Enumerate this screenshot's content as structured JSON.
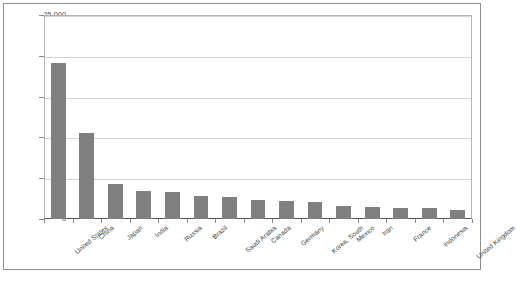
{
  "chart_data": {
    "type": "bar",
    "title": "",
    "subtitle": "",
    "xlabel": "",
    "ylabel": "",
    "categories": [
      "United States",
      "China",
      "Japan",
      "India",
      "Russia",
      "Brazil",
      "Saudi Arabia",
      "Canada",
      "Germany",
      "Korea, South",
      "Mexico",
      "Iran",
      "France",
      "Indonesia",
      "United Kingdom"
    ],
    "values": [
      19100,
      10500,
      4300,
      3400,
      3300,
      2800,
      2700,
      2300,
      2200,
      2100,
      1600,
      1500,
      1400,
      1300,
      1100
    ],
    "ylim": [
      0,
      25000
    ],
    "yticks": [
      0,
      5000,
      10000,
      15000,
      20000,
      25000
    ],
    "ytick_labels": [
      "0",
      "5,000",
      "10,000",
      "15,000",
      "20,000",
      "25,000"
    ],
    "grid": true,
    "legend": false,
    "legend_position": "none",
    "bar_color": "#808080",
    "gridline_color": "#d4d4d4",
    "axis_color": "#555555",
    "plot_border_color": "#b4b4b4",
    "frame_color": "#8d8d8d",
    "background_color": "#ffffff"
  }
}
